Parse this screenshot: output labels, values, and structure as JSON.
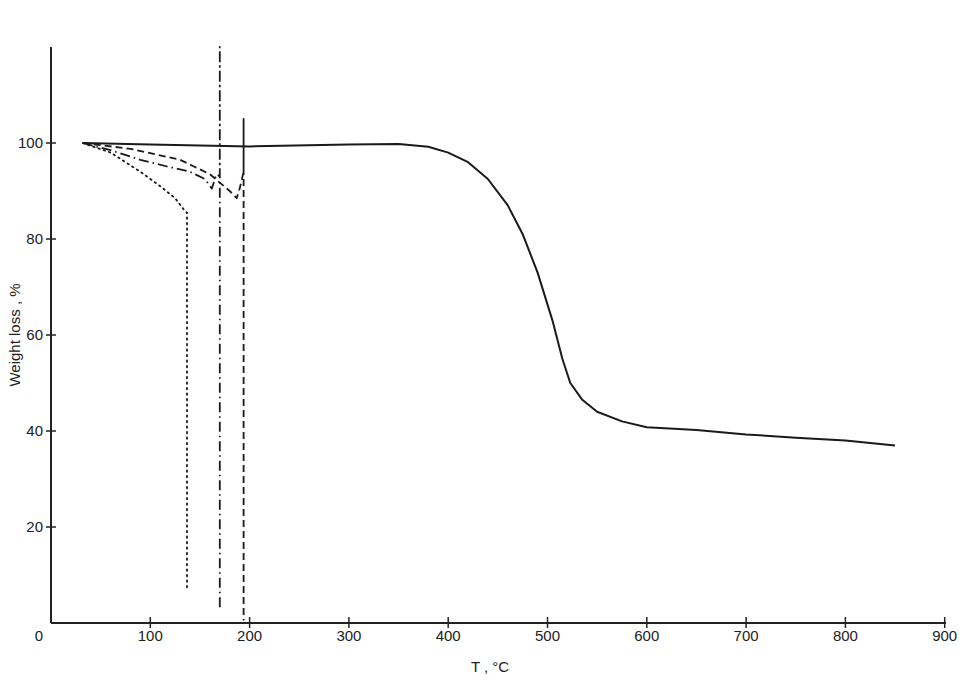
{
  "chart_data": {
    "type": "line",
    "title": "",
    "xlabel": "T ,  °C",
    "ylabel": "Weight  loss ,  %",
    "xlim": [
      0,
      900
    ],
    "ylim": [
      0,
      120
    ],
    "xticks": [
      0,
      100,
      200,
      300,
      400,
      500,
      600,
      700,
      800,
      900
    ],
    "yticks": [
      20,
      40,
      60,
      80,
      100
    ],
    "grid": false,
    "legend": null,
    "series": [
      {
        "name": "solid",
        "style": "solid",
        "x": [
          32,
          100,
          200,
          300,
          350,
          380,
          400,
          420,
          440,
          460,
          475,
          490,
          505,
          515,
          523,
          535,
          550,
          575,
          600,
          650,
          700,
          750,
          800,
          850
        ],
        "y": [
          100,
          99.7,
          99.3,
          99.7,
          99.8,
          99.2,
          98,
          96,
          92.5,
          87,
          81,
          73,
          63,
          55,
          50,
          46.5,
          44,
          42,
          40.8,
          40.2,
          39.3,
          38.6,
          38,
          37
        ]
      },
      {
        "name": "dotted",
        "style": "dotted",
        "x": [
          32,
          60,
          90,
          110,
          125,
          135,
          137,
          137
        ],
        "y": [
          100,
          98,
          94,
          91,
          88.5,
          85.8,
          85.5,
          7
        ]
      },
      {
        "name": "dash-dot",
        "style": "dashdot",
        "x": [
          32,
          60,
          90,
          115,
          140,
          155,
          162,
          165,
          167,
          170,
          170,
          170
        ],
        "y": [
          100,
          98.5,
          96.5,
          95.2,
          94,
          92.5,
          90.5,
          92.5,
          93.5,
          93,
          120,
          3
        ]
      },
      {
        "name": "dashed",
        "style": "dashed",
        "x": [
          32,
          80,
          130,
          160,
          180,
          187,
          190,
          194,
          194,
          194
        ],
        "y": [
          100,
          98.8,
          96.5,
          93.5,
          90,
          88.5,
          90.5,
          94,
          105,
          0.5
        ]
      }
    ]
  }
}
